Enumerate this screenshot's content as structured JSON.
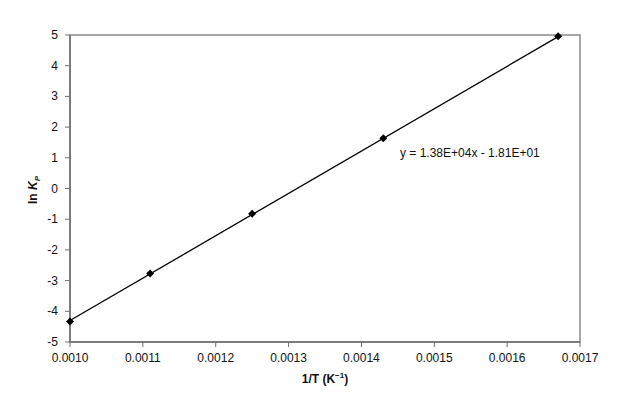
{
  "chart_data": {
    "type": "scatter",
    "title": "",
    "xlabel": "1/T (K⁻¹)",
    "ylabel": "ln K_P",
    "xlim": [
      0.001,
      0.0017
    ],
    "ylim": [
      -5,
      5
    ],
    "x_ticks": [
      "0.0010",
      "0.0011",
      "0.0012",
      "0.0013",
      "0.0014",
      "0.0015",
      "0.0016",
      "0.0017"
    ],
    "y_ticks": [
      "-5",
      "-4",
      "-3",
      "-2",
      "-1",
      "0",
      "1",
      "2",
      "3",
      "4",
      "5"
    ],
    "grid": false,
    "legend": null,
    "series": [
      {
        "name": "ln Kp vs 1/T",
        "marker": "diamond",
        "color": "#000000",
        "x": [
          0.001,
          0.00111,
          0.00125,
          0.00143,
          0.00167
        ],
        "y": [
          -4.33,
          -2.77,
          -0.82,
          1.64,
          4.96
        ]
      }
    ],
    "trendline": {
      "type": "linear",
      "slope": 13800,
      "intercept": -18.1,
      "x_range": [
        0.001,
        0.00167
      ],
      "label": "y = 1.38E+04x - 1.81E+01"
    }
  },
  "axes": {
    "x_title_main": "1/T (K",
    "x_title_sup": "−1",
    "x_title_end": ")",
    "y_title_ln": "ln ",
    "y_title_k": "K",
    "y_title_sub": "P"
  },
  "annotation": {
    "equation": "y = 1.38E+04x - 1.81E+01"
  }
}
